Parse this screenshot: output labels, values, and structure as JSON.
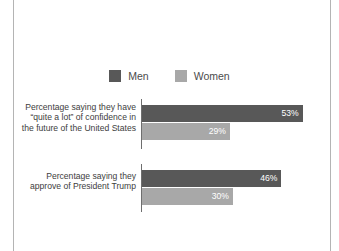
{
  "chart_data": {
    "type": "bar",
    "orientation": "horizontal",
    "title": "",
    "subtitle": "",
    "xlabel": "",
    "ylabel": "",
    "xlim": [
      0,
      62
    ],
    "grid": false,
    "legend_position": "top-center",
    "value_suffix": "%",
    "categories": [
      "Percentage saying they have “quite a lot” of confidence in the future of the United States",
      "Percentage saying they approve of President Trump"
    ],
    "series": [
      {
        "name": "Men",
        "color": "#585858",
        "values": [
          53,
          46
        ],
        "labels": [
          "53%",
          "30%"
        ]
      },
      {
        "name": "Women",
        "color": "#a8a8a8",
        "values": [
          29,
          30
        ],
        "labels": [
          "29%",
          "30%"
        ]
      }
    ],
    "groups": [
      {
        "category": "Percentage saying they have “quite a lot” of confidence in the future of the United States",
        "bars": [
          {
            "series": "Men",
            "value": 53,
            "label": "53%"
          },
          {
            "series": "Women",
            "value": 29,
            "label": "29%"
          }
        ]
      },
      {
        "category": "Percentage saying they approve of President Trump",
        "bars": [
          {
            "series": "Men",
            "value": 46,
            "label": "46%"
          },
          {
            "series": "Women",
            "value": 30,
            "label": "30%"
          }
        ]
      }
    ]
  },
  "legend": {
    "entries": [
      {
        "label": "Men",
        "color": "#585858",
        "swatch_icon": "legend-swatch-icon"
      },
      {
        "label": "Women",
        "color": "#a8a8a8",
        "swatch_icon": "legend-swatch-icon"
      }
    ]
  },
  "colors": {
    "men": "#585858",
    "women": "#a8a8a8",
    "axis": "#6e6e6e",
    "frame_rule": "#b4b4b4",
    "label_text": "#3d3d3d",
    "value_text": "#ffffff",
    "background": "#ffffff"
  }
}
